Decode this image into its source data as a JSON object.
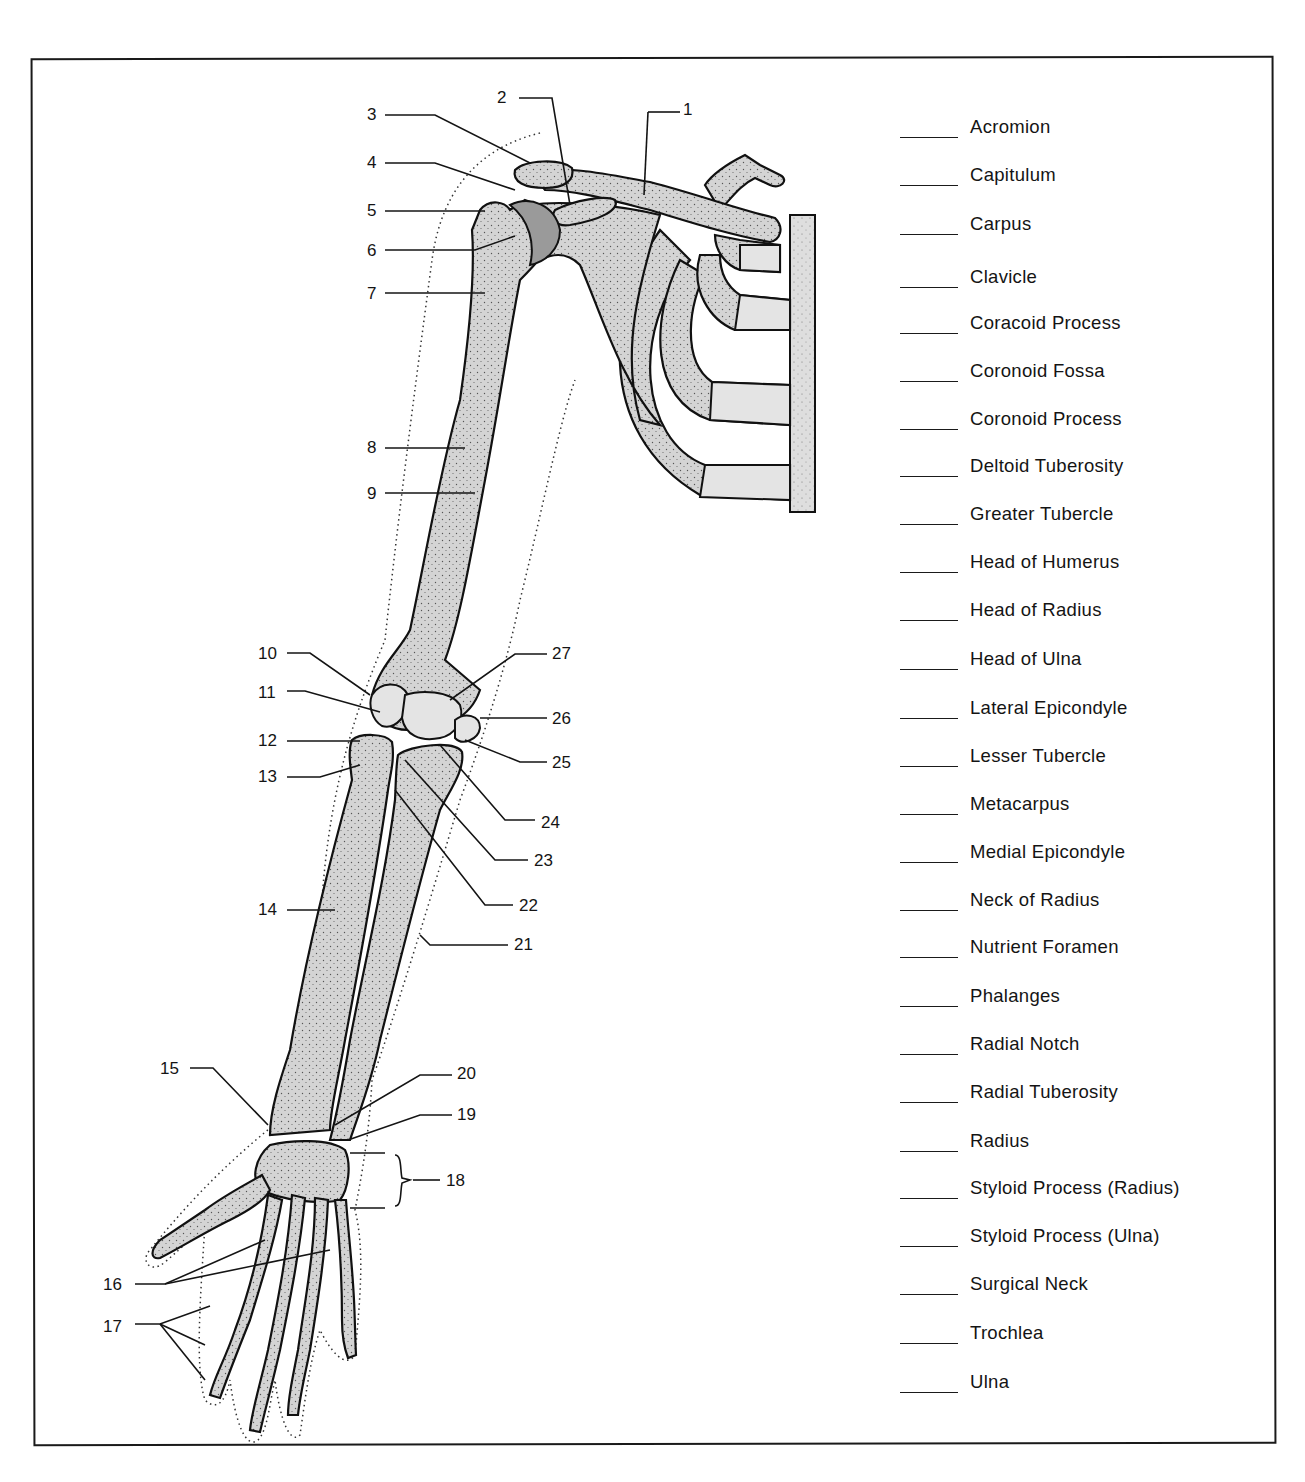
{
  "worksheet": {
    "title": "Bones of the Upper Limb and Shoulder Girdle",
    "callouts": [
      {
        "n": "1",
        "x": 683,
        "y": 115
      },
      {
        "n": "2",
        "x": 497,
        "y": 103
      },
      {
        "n": "3",
        "x": 367,
        "y": 120
      },
      {
        "n": "4",
        "x": 367,
        "y": 168
      },
      {
        "n": "5",
        "x": 367,
        "y": 216
      },
      {
        "n": "6",
        "x": 367,
        "y": 256
      },
      {
        "n": "7",
        "x": 367,
        "y": 299
      },
      {
        "n": "8",
        "x": 367,
        "y": 453
      },
      {
        "n": "9",
        "x": 367,
        "y": 499
      },
      {
        "n": "10",
        "x": 258,
        "y": 659
      },
      {
        "n": "11",
        "x": 258,
        "y": 698
      },
      {
        "n": "12",
        "x": 258,
        "y": 746
      },
      {
        "n": "13",
        "x": 258,
        "y": 782
      },
      {
        "n": "14",
        "x": 258,
        "y": 915
      },
      {
        "n": "15",
        "x": 160,
        "y": 1074
      },
      {
        "n": "16",
        "x": 103,
        "y": 1290
      },
      {
        "n": "17",
        "x": 103,
        "y": 1332
      },
      {
        "n": "18",
        "x": 446,
        "y": 1186
      },
      {
        "n": "19",
        "x": 457,
        "y": 1120
      },
      {
        "n": "20",
        "x": 457,
        "y": 1079
      },
      {
        "n": "21",
        "x": 514,
        "y": 950
      },
      {
        "n": "22",
        "x": 519,
        "y": 911
      },
      {
        "n": "23",
        "x": 534,
        "y": 866
      },
      {
        "n": "24",
        "x": 541,
        "y": 828
      },
      {
        "n": "25",
        "x": 552,
        "y": 768
      },
      {
        "n": "26",
        "x": 552,
        "y": 724
      },
      {
        "n": "27",
        "x": 552,
        "y": 659
      }
    ],
    "terms": [
      {
        "label": "Acromion",
        "answer": "",
        "y": 128
      },
      {
        "label": "Capitulum",
        "answer": "",
        "y": 176
      },
      {
        "label": "Carpus",
        "answer": "",
        "y": 225
      },
      {
        "label": "Clavicle",
        "answer": "",
        "y": 278
      },
      {
        "label": "Coracoid Process",
        "answer": "",
        "y": 324
      },
      {
        "label": "Coronoid Fossa",
        "answer": "",
        "y": 372
      },
      {
        "label": "Coronoid Process",
        "answer": "",
        "y": 420
      },
      {
        "label": "Deltoid  Tuberosity",
        "answer": "",
        "y": 467
      },
      {
        "label": "Greater  Tubercle",
        "answer": "",
        "y": 515
      },
      {
        "label": "Head of Humerus",
        "answer": "",
        "y": 563
      },
      {
        "label": "Head of Radius",
        "answer": "",
        "y": 611
      },
      {
        "label": "Head of Ulna",
        "answer": "",
        "y": 660
      },
      {
        "label": "Lateral Epicondyle",
        "answer": "",
        "y": 709
      },
      {
        "label": "Lesser Tubercle",
        "answer": "",
        "y": 757
      },
      {
        "label": "Metacarpus",
        "answer": "",
        "y": 805
      },
      {
        "label": "Medial Epicondyle",
        "answer": "",
        "y": 853
      },
      {
        "label": "Neck of Radius",
        "answer": "",
        "y": 901
      },
      {
        "label": "Nutrient Foramen",
        "answer": "",
        "y": 948
      },
      {
        "label": "Phalanges",
        "answer": "",
        "y": 997
      },
      {
        "label": "Radial Notch",
        "answer": "",
        "y": 1045
      },
      {
        "label": "Radial Tuberosity",
        "answer": "",
        "y": 1093
      },
      {
        "label": "Radius",
        "answer": "",
        "y": 1142
      },
      {
        "label": "Styloid Process (Radius)",
        "answer": "",
        "y": 1189
      },
      {
        "label": "Styloid Process (Ulna)",
        "answer": "",
        "y": 1237
      },
      {
        "label": "Surgical Neck",
        "answer": "",
        "y": 1285
      },
      {
        "label": "Trochlea",
        "answer": "",
        "y": 1334
      },
      {
        "label": "Ulna",
        "answer": "",
        "y": 1383
      }
    ]
  },
  "colors": {
    "bone_fill": "#d4d4d4",
    "cartilage_fill": "#e4e4e4",
    "head_of_humerus_fill": "#9a9a9a",
    "line": "#111111",
    "background": "#ffffff"
  }
}
